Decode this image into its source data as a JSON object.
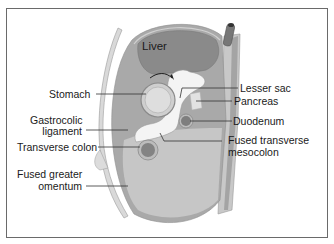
{
  "diagram": {
    "labels": {
      "liver": "Liver",
      "stomach": "Stomach",
      "gastrocolic_1": "Gastrocolic",
      "gastrocolic_2": "ligament",
      "transverse_colon": "Transverse colon",
      "fused_greater_1": "Fused greater",
      "fused_greater_2": "omentum",
      "lesser_sac": "Lesser sac",
      "pancreas": "Pancreas",
      "duodenum": "Duodenum",
      "fused_transverse_1": "Fused transverse",
      "fused_transverse_2": "mesocolon"
    },
    "colors": {
      "organ_dark": "#8a8a8a",
      "peritoneum_mid": "#a9a9a9",
      "cavity_light": "#c9c9c9",
      "lesser_sac_white": "#f4f4f4",
      "wall": "#d8d8d8",
      "leader_line": "#333333",
      "frame": "#6a6a6a"
    }
  }
}
